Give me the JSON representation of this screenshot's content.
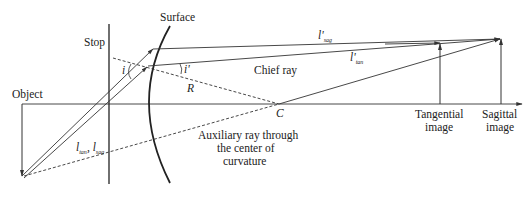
{
  "diagram": {
    "labels": {
      "stop": "Stop",
      "surface": "Surface",
      "object": "Object",
      "chief_ray": "Chief ray",
      "angle_incidence": "i",
      "angle_refraction": "i'",
      "radius": "R",
      "center": "C",
      "l_sag_prime": "l'",
      "l_sag_prime_sub": "sag",
      "l_tan_prime": "l'",
      "l_tan_prime_sub": "tan",
      "l_obj_tan": "l",
      "l_obj_tan_sub": "tan",
      "l_obj_sag": "l",
      "l_obj_sag_sub": "sag",
      "tangential_image_line1": "Tangential",
      "tangential_image_line2": "image",
      "sagittal_image_line1": "Sagittal",
      "sagittal_image_line2": "image",
      "auxiliary_line1": "Auxiliary ray through",
      "auxiliary_line2": "the center of",
      "auxiliary_line3": "curvature"
    },
    "colors": {
      "line": "#333333",
      "text": "#222222",
      "background": "#ffffff"
    }
  }
}
